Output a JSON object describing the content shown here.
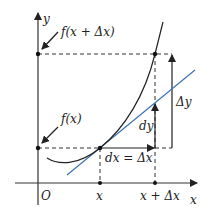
{
  "diagram": {
    "axes": {
      "x_label": "x",
      "y_label": "y",
      "origin_label": "O"
    },
    "x_ticks": [
      {
        "label": "x"
      },
      {
        "label": "x + Δx"
      }
    ],
    "y_annotations": [
      {
        "label": "f(x + Δx)"
      },
      {
        "label": "f(x)"
      }
    ],
    "segment_labels": {
      "dx": "dx = Δx",
      "dy": "dy",
      "delta_y": "Δy"
    },
    "colors": {
      "curve": "#222222",
      "tangent": "#3a6fb0",
      "axes": "#333333",
      "dashed": "#333333"
    }
  }
}
